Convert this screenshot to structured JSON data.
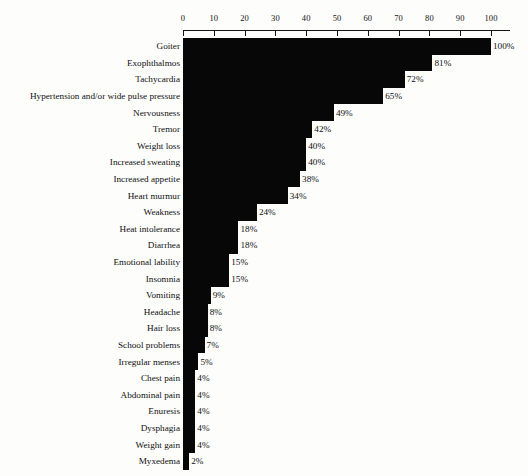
{
  "chart_data": {
    "type": "bar",
    "orientation": "horizontal",
    "title": "",
    "subtitle": "",
    "xlabel": "",
    "ylabel": "",
    "xlim": [
      0,
      100
    ],
    "xticks": [
      0,
      10,
      20,
      30,
      40,
      50,
      60,
      70,
      80,
      90,
      100
    ],
    "xtick_labels": [
      "0",
      "10",
      "20",
      "30",
      "40",
      "50",
      "60",
      "70",
      "80",
      "90",
      "100"
    ],
    "grid": false,
    "legend": null,
    "value_label_suffix": "%",
    "bar_color": "#070707",
    "background_color": "#fdfdfc",
    "axis_color": "#141414",
    "categories": [
      "Goiter",
      "Exophthalmos",
      "Tachycardia",
      "Hypertension and/or wide pulse pressure",
      "Nervousness",
      "Tremor",
      "Weight loss",
      "Increased sweating",
      "Increased appetite",
      "Heart murmur",
      "Weakness",
      "Heat intolerance",
      "Diarrhea",
      "Emotional lability",
      "Insomnia",
      "Vomiting",
      "Headache",
      "Hair loss",
      "School problems",
      "Irregular menses",
      "Chest pain",
      "Abdominal pain",
      "Enuresis",
      "Dysphagia",
      "Weight gain",
      "Myxedema"
    ],
    "values": [
      100,
      81,
      72,
      65,
      49,
      42,
      40,
      40,
      38,
      34,
      24,
      18,
      18,
      15,
      15,
      9,
      8,
      8,
      7,
      5,
      4,
      4,
      4,
      4,
      4,
      2
    ],
    "value_labels": [
      "100%",
      "81%",
      "72%",
      "65%",
      "49%",
      "42%",
      "40%",
      "40%",
      "38%",
      "34%",
      "24%",
      "18%",
      "18%",
      "15%",
      "15%",
      "9%",
      "8%",
      "8%",
      "7%",
      "5%",
      "4%",
      "4%",
      "4%",
      "4%",
      "4%",
      "2%"
    ]
  }
}
